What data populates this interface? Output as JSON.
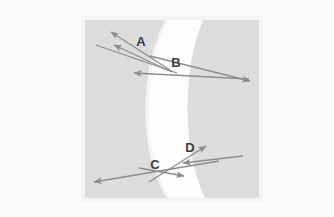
{
  "figure": {
    "background_color": "#fbfbfb",
    "panel": {
      "fill_color": "#dcdcdc",
      "outer_border_color": "#f3f3f3",
      "x": 85,
      "y": 20,
      "width": 174,
      "height": 178
    },
    "lens_band": {
      "name": "meniscus-lens-band",
      "fill_color": "#fdfdfd",
      "edge_color": "#f2f2f2",
      "description": "white crescent band curving to the left"
    },
    "ray_color": "#8c8c8c",
    "label_color": "#3d3d3d",
    "labels": [
      {
        "id": "A",
        "text": "A",
        "x": 141,
        "y": 41
      },
      {
        "id": "B",
        "text": "B",
        "x": 176,
        "y": 63
      },
      {
        "id": "C",
        "text": "C",
        "x": 155,
        "y": 165
      },
      {
        "id": "D",
        "text": "D",
        "x": 190,
        "y": 149
      }
    ],
    "rays": [
      {
        "id": "incident-upper",
        "label": "incident ray upper group",
        "x1": 96,
        "y1": 45,
        "x2": 175,
        "y2": 72,
        "arrow_at": "none"
      },
      {
        "id": "reflected-upper-outer",
        "label": "reflected ray toward A outer",
        "x1": 168,
        "y1": 68,
        "x2": 110,
        "y2": 31,
        "arrow_at": "end"
      },
      {
        "id": "reflected-upper-inner",
        "label": "reflected ray toward A inner",
        "x1": 170,
        "y1": 70,
        "x2": 113,
        "y2": 44,
        "arrow_at": "end"
      },
      {
        "id": "transmitted-upper-right",
        "label": "transmitted ray to the right past B",
        "x1": 150,
        "y1": 55,
        "x2": 251,
        "y2": 81,
        "arrow_at": "end"
      },
      {
        "id": "horizontal-left-upper",
        "label": "ray pointing left at B level",
        "x1": 249,
        "y1": 79,
        "x2": 133,
        "y2": 73,
        "arrow_at": "end"
      },
      {
        "id": "lower-long-left",
        "label": "ray pointing to lower left",
        "x1": 218,
        "y1": 161,
        "x2": 93,
        "y2": 182,
        "arrow_at": "end"
      },
      {
        "id": "lower-short-right",
        "label": "short ray pointing right at C",
        "x1": 140,
        "y1": 168,
        "x2": 184,
        "y2": 176,
        "arrow_at": "end"
      },
      {
        "id": "lower-up-right",
        "label": "ray pointing up-right toward D",
        "x1": 150,
        "y1": 181,
        "x2": 207,
        "y2": 146,
        "arrow_at": "end"
      },
      {
        "id": "lower-from-right",
        "label": "ray entering from right edge pointing left",
        "x1": 242,
        "y1": 156,
        "x2": 182,
        "y2": 163,
        "arrow_at": "end"
      }
    ]
  }
}
